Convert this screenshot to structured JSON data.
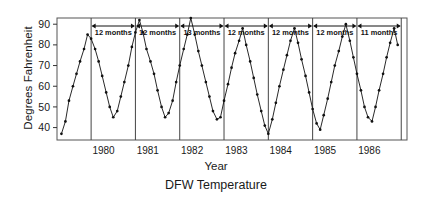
{
  "caption": "DFW Temperature",
  "axis": {
    "ylabel": "Degrees Fahrenheit",
    "xlabel": "Year"
  },
  "chart_data": {
    "type": "line",
    "title": "DFW Temperature",
    "xlabel": "Year",
    "ylabel": "Degrees Fahrenheit",
    "ylim": [
      34,
      93
    ],
    "yticks": [
      40,
      50,
      60,
      70,
      80,
      90
    ],
    "xticks": [
      1980,
      1981,
      1982,
      1983,
      1984,
      1985,
      1986
    ],
    "xtick_labels": [
      "1980",
      "1981",
      "1982",
      "1983",
      "1984",
      "1985",
      "1986"
    ],
    "xlim": [
      1979.2,
      1987.1
    ],
    "grid": false,
    "legend": null,
    "marker": "filled-circle",
    "line_color": "#111111",
    "series": [
      {
        "name": "Monthly mean temperature",
        "x": [
          1979.3,
          1979.39,
          1979.47,
          1979.56,
          1979.64,
          1979.72,
          1979.81,
          1979.89,
          1979.97,
          1980.06,
          1980.14,
          1980.22,
          1980.31,
          1980.39,
          1980.47,
          1980.56,
          1980.64,
          1980.72,
          1980.81,
          1980.89,
          1980.97,
          1981.06,
          1981.14,
          1981.22,
          1981.31,
          1981.39,
          1981.47,
          1981.56,
          1981.64,
          1981.72,
          1981.81,
          1981.89,
          1981.97,
          1982.06,
          1982.14,
          1982.22,
          1982.31,
          1982.39,
          1982.47,
          1982.56,
          1982.64,
          1982.72,
          1982.81,
          1982.89,
          1982.97,
          1983.06,
          1983.14,
          1983.22,
          1983.31,
          1983.39,
          1983.47,
          1983.56,
          1983.64,
          1983.72,
          1983.81,
          1983.89,
          1983.97,
          1984.06,
          1984.14,
          1984.22,
          1984.31,
          1984.39,
          1984.47,
          1984.56,
          1984.64,
          1984.72,
          1984.81,
          1984.89,
          1984.97,
          1985.06,
          1985.14,
          1985.22,
          1985.31,
          1985.39,
          1985.47,
          1985.56,
          1985.64,
          1985.72,
          1985.81,
          1985.89,
          1985.97,
          1986.06,
          1986.14,
          1986.22,
          1986.31,
          1986.39,
          1986.47,
          1986.56,
          1986.64,
          1986.72,
          1986.81,
          1986.89
        ],
        "values": [
          37,
          43,
          53,
          60,
          66,
          72,
          78,
          85,
          83,
          78,
          72,
          65,
          57,
          50,
          45,
          48,
          55,
          62,
          70,
          79,
          86,
          92,
          86,
          78,
          72,
          66,
          58,
          50,
          45,
          47,
          53,
          62,
          70,
          78,
          85,
          93,
          85,
          77,
          70,
          62,
          55,
          48,
          44,
          45,
          53,
          61,
          69,
          76,
          82,
          88,
          80,
          72,
          64,
          56,
          48,
          41,
          37,
          44,
          52,
          60,
          68,
          75,
          82,
          88,
          81,
          73,
          65,
          57,
          49,
          42,
          39,
          46,
          54,
          62,
          70,
          77,
          84,
          90,
          82,
          74,
          66,
          58,
          50,
          45,
          43,
          50,
          58,
          66,
          74,
          81,
          88,
          80
        ]
      }
    ],
    "vlines": [
      1979.97,
      1980.97,
      1981.97,
      1982.97,
      1983.97,
      1984.97,
      1985.97,
      1986.97
    ],
    "annotations": [
      {
        "label": "12 months",
        "from": 1979.97,
        "to": 1980.97
      },
      {
        "label": "12 months",
        "from": 1980.97,
        "to": 1981.97
      },
      {
        "label": "13 months",
        "from": 1981.97,
        "to": 1982.97
      },
      {
        "label": "12 months",
        "from": 1982.97,
        "to": 1983.97
      },
      {
        "label": "12 months",
        "from": 1983.97,
        "to": 1984.97
      },
      {
        "label": "12 months",
        "from": 1984.97,
        "to": 1985.97
      },
      {
        "label": "11 months",
        "from": 1985.97,
        "to": 1986.97
      }
    ]
  }
}
